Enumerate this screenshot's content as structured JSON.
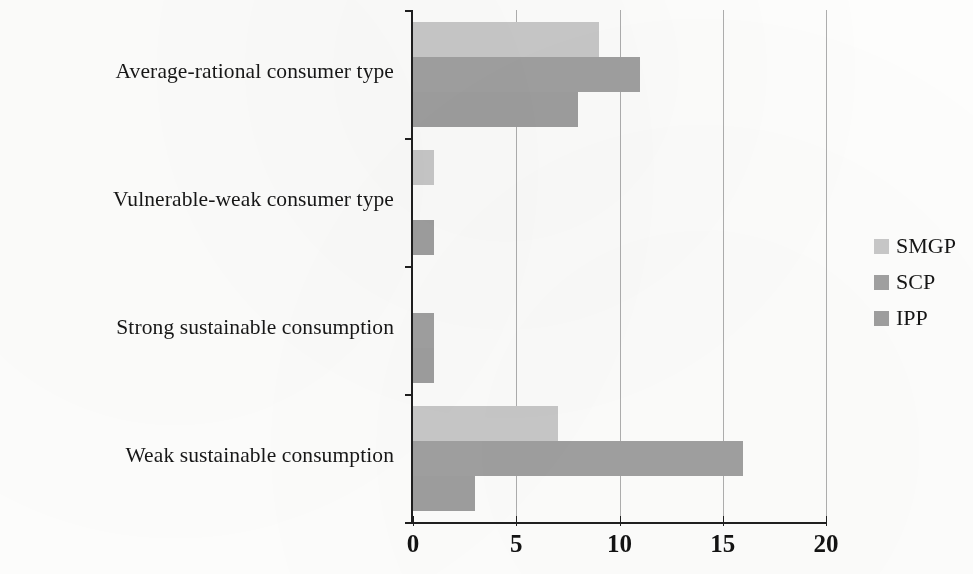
{
  "chart_data": {
    "type": "bar",
    "orientation": "horizontal",
    "title": "",
    "subtitle": "",
    "xlabel": "",
    "ylabel": "",
    "xlim": [
      0,
      20
    ],
    "xticks": [
      0,
      5,
      10,
      15,
      20
    ],
    "xtick_labels": [
      "0",
      "5",
      "10",
      "15",
      "20"
    ],
    "grid": true,
    "grid_axis": "x",
    "legend_position": "right",
    "categories": [
      "Average-rational consumer type",
      "Vulnerable-weak consumer type",
      "Strong sustainable consumption",
      "Weak sustainable consumption"
    ],
    "series": [
      {
        "name": "SMGP",
        "color": "#c8c8c8",
        "values": [
          9,
          1,
          0,
          7
        ]
      },
      {
        "name": "SCP",
        "color": "#a0a0a0",
        "values": [
          11,
          0,
          1,
          16
        ]
      },
      {
        "name": "IPP",
        "color": "#9e9e9e",
        "values": [
          8,
          1,
          1,
          3
        ]
      }
    ]
  },
  "legend": {
    "items": [
      {
        "label": "SMGP",
        "color": "#c8c8c8"
      },
      {
        "label": "SCP",
        "color": "#a0a0a0"
      },
      {
        "label": "IPP",
        "color": "#9e9e9e"
      }
    ]
  },
  "axis": {
    "x_tick_labels": [
      "0",
      "5",
      "10",
      "15",
      "20"
    ],
    "category_labels": [
      "Average-rational consumer type",
      "Vulnerable-weak consumer type",
      "Strong sustainable consumption",
      "Weak sustainable consumption"
    ]
  },
  "colors": {
    "background": "#fdfdfc",
    "axis": "#1f1f1f",
    "gridline": "#aeaeae",
    "text": "#171717"
  }
}
